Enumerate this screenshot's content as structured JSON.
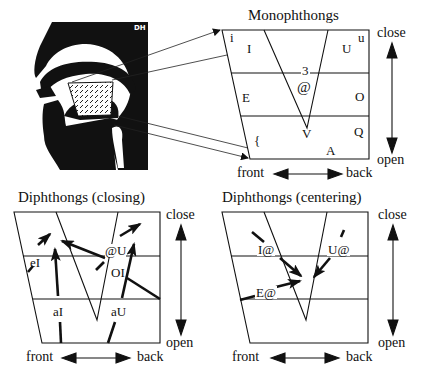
{
  "head": {
    "label": "DH"
  },
  "monophthongs": {
    "title": "Monophthongs",
    "symbols": [
      {
        "text": "i",
        "x": 230,
        "y": 33
      },
      {
        "text": "I",
        "x": 248,
        "y": 42
      },
      {
        "text": "u",
        "x": 357,
        "y": 32
      },
      {
        "text": "U",
        "x": 342,
        "y": 42
      },
      {
        "text": "3",
        "x": 301,
        "y": 65
      },
      {
        "text": "@",
        "x": 297,
        "y": 80
      },
      {
        "text": "E",
        "x": 242,
        "y": 91
      },
      {
        "text": "O",
        "x": 355,
        "y": 90
      },
      {
        "text": "V",
        "x": 303,
        "y": 126
      },
      {
        "text": "Q",
        "x": 354,
        "y": 124
      },
      {
        "text": "{",
        "x": 254,
        "y": 134
      },
      {
        "text": "A",
        "x": 326,
        "y": 145
      }
    ],
    "axis": {
      "close": "close",
      "open": "open",
      "front": "front",
      "back": "back"
    }
  },
  "closing": {
    "title": "Diphthongs (closing)",
    "symbols": [
      {
        "text": "eI",
        "x": 31,
        "y": 257
      },
      {
        "text": "@U",
        "x": 106,
        "y": 245
      },
      {
        "text": "OI",
        "x": 111,
        "y": 267
      },
      {
        "text": "aI",
        "x": 53,
        "y": 306
      },
      {
        "text": "aU",
        "x": 112,
        "y": 306
      }
    ],
    "axis": {
      "close": "close",
      "open": "open",
      "front": "front",
      "back": "back"
    }
  },
  "centering": {
    "title": "Diphthongs (centering)",
    "symbols": [
      {
        "text": "I@",
        "x": 258,
        "y": 244
      },
      {
        "text": "U@",
        "x": 328,
        "y": 244
      },
      {
        "text": "E@",
        "x": 255,
        "y": 287
      }
    ],
    "axis": {
      "close": "close",
      "open": "open",
      "front": "front",
      "back": "back"
    }
  }
}
